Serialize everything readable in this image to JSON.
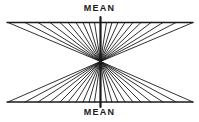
{
  "diagram": {
    "labels": {
      "top": "MEAN",
      "bottom": "MEAN"
    },
    "colors": {
      "ink": "#1a1a1a",
      "background": "#ffffff"
    },
    "geometry": {
      "width": 199,
      "height": 122,
      "top_line": {
        "x1": 7,
        "x2": 193,
        "y": 22.5
      },
      "bottom_line": {
        "x1": 7,
        "x2": 193,
        "y": 102
      },
      "center": {
        "x": 100.5,
        "y": 61.5
      },
      "axis": {
        "y1": 17,
        "y2": 107
      },
      "fan_x_offsets": [
        92.5,
        75.5,
        62.5,
        50.5,
        40.5,
        32.5,
        24.5,
        17.5,
        11.5,
        6
      ],
      "line_width": {
        "horizontal": 1.3,
        "axis": 2.2,
        "fan": 0.9
      }
    }
  }
}
